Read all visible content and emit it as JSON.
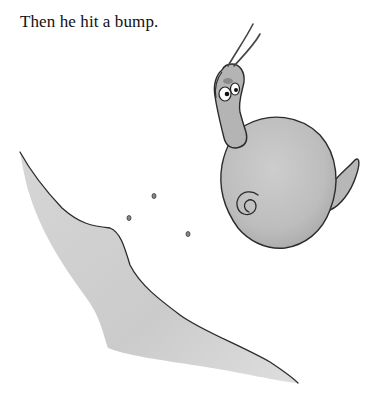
{
  "page": {
    "caption": "Then he hit a bump."
  },
  "illustration": {
    "subject": "snail flying through the air over a bump",
    "elements": [
      "snail",
      "snail-shell",
      "shell-spiral",
      "snail-head",
      "eyes",
      "antennae",
      "snail-tail",
      "bump-hill",
      "dirt-specks"
    ],
    "colors": {
      "ink": "#2b2b2b",
      "body_gray": "#b9b9b9",
      "shell_gray": "#c4c4c4",
      "hill_gray": "#cfcfcf",
      "background": "#ffffff"
    }
  }
}
